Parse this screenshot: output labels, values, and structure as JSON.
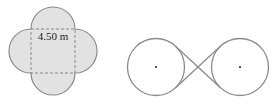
{
  "figures": {
    "left": {
      "description": "Square with four semicircles on each side (quatrefoil shape)",
      "dimension_label": "4.50 m",
      "square": {
        "x": 31,
        "y": 29,
        "side": 44,
        "dashed": true
      },
      "semicircle_radius": 22,
      "colors": {
        "fill": "#e2e2e2",
        "stroke": "#8a8a8a",
        "dash": "#8a8a8a",
        "text": "#222222"
      }
    },
    "right": {
      "description": "Two equal circles connected by a crossed belt (internal tangent lines)",
      "circles": [
        {
          "cx": 156,
          "cy": 67,
          "r": 28.5,
          "center_dot": true
        },
        {
          "cx": 240,
          "cy": 67,
          "r": 28.5,
          "center_dot": true
        }
      ],
      "crossing_point": {
        "x": 198,
        "y": 67
      },
      "colors": {
        "stroke": "#8a8a8a",
        "dot": "#222222"
      }
    }
  }
}
